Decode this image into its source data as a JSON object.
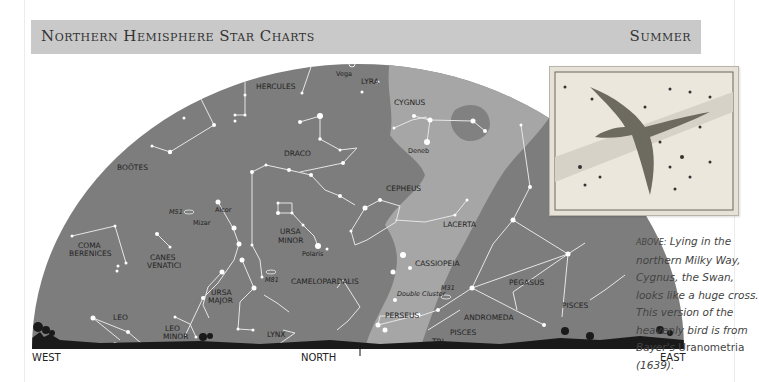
{
  "header": {
    "title": "Northern Hemisphere Star Charts",
    "season": "Summer"
  },
  "chart": {
    "directions": {
      "west": "WEST",
      "north": "NORTH",
      "east": "EAST"
    },
    "constellations": [
      {
        "id": "hercules",
        "label": "HERCULES"
      },
      {
        "id": "lyra",
        "label": "LYRA"
      },
      {
        "id": "cygnus",
        "label": "CYGNUS"
      },
      {
        "id": "bootes",
        "label": "BOÖTES"
      },
      {
        "id": "draco",
        "label": "DRACO"
      },
      {
        "id": "cepheus",
        "label": "CEPHEUS"
      },
      {
        "id": "lacerta",
        "label": "LACERTA"
      },
      {
        "id": "ursa-minor-1",
        "label": "URSA"
      },
      {
        "id": "ursa-minor-2",
        "label": "MINOR"
      },
      {
        "id": "coma-1",
        "label": "COMA"
      },
      {
        "id": "coma-2",
        "label": "BERENICES"
      },
      {
        "id": "canes-1",
        "label": "CANES"
      },
      {
        "id": "canes-2",
        "label": "VENATICI"
      },
      {
        "id": "ursa-major-1",
        "label": "URSA"
      },
      {
        "id": "ursa-major-2",
        "label": "MAJOR"
      },
      {
        "id": "camelopardalis",
        "label": "CAMELOPARDALIS"
      },
      {
        "id": "cassiopeia",
        "label": "CASSIOPEIA"
      },
      {
        "id": "pegasus",
        "label": "PEGASUS"
      },
      {
        "id": "perseus",
        "label": "PERSEUS"
      },
      {
        "id": "andromeda",
        "label": "ANDROMEDA"
      },
      {
        "id": "pisces-east",
        "label": "PISCES"
      },
      {
        "id": "pisces",
        "label": "PISCES"
      },
      {
        "id": "leo",
        "label": "LEO"
      },
      {
        "id": "leo-minor-1",
        "label": "LEO"
      },
      {
        "id": "leo-minor-2",
        "label": "MINOR"
      },
      {
        "id": "lynx",
        "label": "LYNX"
      },
      {
        "id": "tri",
        "label": "TRI"
      }
    ],
    "stars": [
      {
        "label": "Vega"
      },
      {
        "label": "Deneb"
      },
      {
        "label": "Alcor"
      },
      {
        "label": "Mizar"
      },
      {
        "label": "Polaris"
      }
    ],
    "deep_sky": [
      {
        "label": "M51"
      },
      {
        "label": "M81"
      },
      {
        "label": "M31"
      },
      {
        "label": "Double Cluster"
      }
    ]
  },
  "inset": {
    "description": "Bayer's Uranometria engraving of Cygnus, the Swan"
  },
  "caption": {
    "lead": "Above:",
    "body1": " Lying in the northern Milky Way, Cygnus, the Swan, looks like a huge cross. This version of the heavenly bird is from Bayer's ",
    "book": "Uranometria",
    "year": " (1639)."
  },
  "colors": {
    "sky": "#7d7d7d",
    "milky_way": "#a6a6a6",
    "header_bar": "#c9c9c9",
    "horizon": "#1a1a1a"
  }
}
